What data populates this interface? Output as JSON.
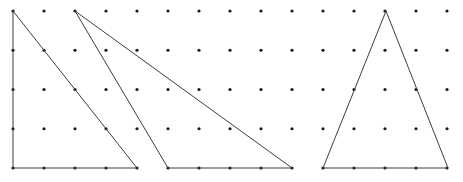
{
  "figure": {
    "canvas": {
      "width": 463,
      "height": 182,
      "background": "#ffffff"
    },
    "lattice": {
      "name": "dot-grid",
      "origin_x": 13,
      "origin_y": 11,
      "step_x": 31,
      "step_y": 39.25,
      "columns": 15,
      "rows": 5,
      "dot_radius": 1.6,
      "dot_color": "#1a1a1a"
    },
    "stroke_color": "#3d3d3d",
    "stroke_width": 1,
    "shapes": [
      {
        "name": "triangle-left-right-angled",
        "label": "Triangle 1",
        "kind": "triangle",
        "grid_points": [
          [
            0,
            0
          ],
          [
            0,
            4
          ],
          [
            4,
            4
          ]
        ],
        "points": "13,11 13,168 137,168"
      },
      {
        "name": "triangle-middle-scalene",
        "label": "Triangle 2",
        "kind": "triangle",
        "grid_points": [
          [
            2,
            0
          ],
          [
            5,
            4
          ],
          [
            9,
            4
          ]
        ],
        "points": "75,11 168,168 292,168"
      },
      {
        "name": "triangle-right-isosceles",
        "label": "Triangle 3",
        "kind": "triangle",
        "grid_points": [
          [
            12,
            0
          ],
          [
            10,
            4
          ],
          [
            14,
            4
          ]
        ],
        "points": "386,11 323,168 448,168"
      }
    ]
  }
}
